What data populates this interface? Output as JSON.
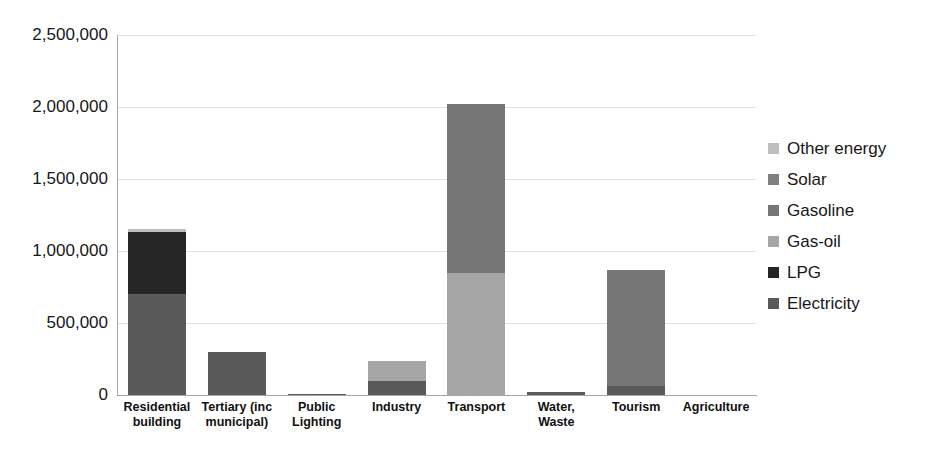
{
  "chart_data": {
    "type": "bar",
    "subtype": "stacked-vertical",
    "title": "",
    "xlabel": "",
    "ylabel": "",
    "ylim": [
      0,
      2500000
    ],
    "grid": true,
    "legend_position": "right",
    "y_ticks": [
      {
        "value": 2500000,
        "label": "2,500,000"
      },
      {
        "value": 2000000,
        "label": "2,000,000"
      },
      {
        "value": 1500000,
        "label": "1,500,000"
      },
      {
        "value": 1000000,
        "label": "1,000,000"
      },
      {
        "value": 500000,
        "label": "500,000"
      },
      {
        "value": 0,
        "label": "0"
      }
    ],
    "categories": [
      "Residential building",
      "Tertiary (inc municipal)",
      "Public Lighting",
      "Industry",
      "Transport",
      "Water, Waste",
      "Tourism",
      "Agriculture"
    ],
    "category_label_lines": [
      [
        "Residential",
        "building"
      ],
      [
        "Tertiary (inc",
        "municipal)"
      ],
      [
        "Public",
        "Lighting"
      ],
      [
        "Industry"
      ],
      [
        "Transport"
      ],
      [
        "Water,",
        "Waste"
      ],
      [
        "Tourism"
      ],
      [
        "Agriculture"
      ]
    ],
    "series": [
      {
        "name": "Electricity",
        "color": "#595959",
        "values": [
          700000,
          300000,
          5000,
          100000,
          0,
          20000,
          60000,
          0
        ]
      },
      {
        "name": "LPG",
        "color": "#262626",
        "values": [
          430000,
          0,
          0,
          0,
          0,
          0,
          0,
          0
        ]
      },
      {
        "name": "Gas-oil",
        "color": "#a6a6a6",
        "values": [
          0,
          0,
          0,
          135000,
          845000,
          0,
          0,
          0
        ]
      },
      {
        "name": "Gasoline",
        "color": "#767676",
        "values": [
          0,
          0,
          0,
          0,
          1175000,
          0,
          805000,
          0
        ]
      },
      {
        "name": "Solar",
        "color": "#808080",
        "values": [
          0,
          0,
          0,
          0,
          0,
          0,
          0,
          0
        ]
      },
      {
        "name": "Other energy",
        "color": "#bfbfbf",
        "values": [
          25000,
          0,
          0,
          0,
          0,
          0,
          0,
          0
        ]
      }
    ],
    "totals": [
      1155000,
      300000,
      5000,
      235000,
      2020000,
      20000,
      865000,
      0
    ]
  },
  "legend": {
    "entries": [
      {
        "label": "Other energy",
        "color": "#bfbfbf"
      },
      {
        "label": "Solar",
        "color": "#808080"
      },
      {
        "label": "Gasoline",
        "color": "#767676"
      },
      {
        "label": "Gas-oil",
        "color": "#a6a6a6"
      },
      {
        "label": "LPG",
        "color": "#262626"
      },
      {
        "label": "Electricity",
        "color": "#595959"
      }
    ]
  },
  "axes": {
    "grid_color": "#e2e2e2",
    "axis_color": "#a6a6a6"
  }
}
